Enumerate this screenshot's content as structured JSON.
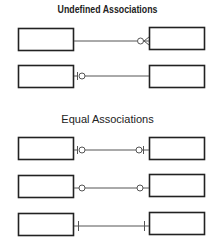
{
  "sections": [
    {
      "title": "Undefined Associations",
      "rows": [
        {
          "left": "zero-or-many-left-none",
          "left_end": "none",
          "right_end": "zero-or-many"
        },
        {
          "left_end": "zero-or-one",
          "right_end": "none"
        }
      ]
    },
    {
      "title": "Equal Associations",
      "rows": [
        {
          "left_end": "zero-or-one",
          "right_end": "zero-or-one"
        },
        {
          "left_end": "zero",
          "right_end": "zero"
        },
        {
          "left_end": "one",
          "right_end": "one"
        }
      ]
    }
  ],
  "colors": {
    "stroke": "#222222",
    "line": "#555555",
    "background": "#ffffff"
  }
}
